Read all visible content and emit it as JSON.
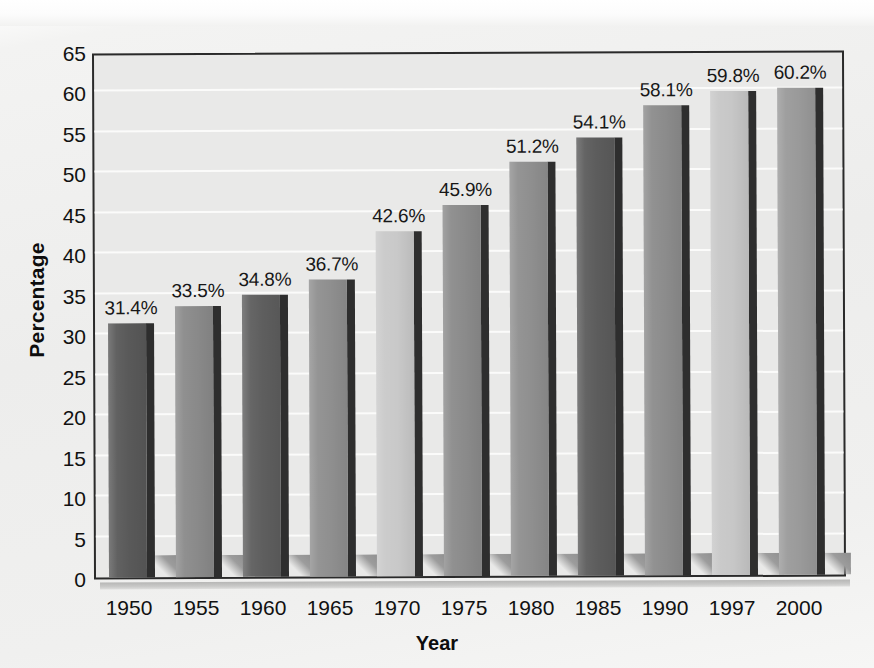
{
  "chart_data": {
    "type": "bar",
    "title": "",
    "xlabel": "Year",
    "ylabel": "Percentage",
    "categories": [
      "1950",
      "1955",
      "1960",
      "1965",
      "1970",
      "1975",
      "1980",
      "1985",
      "1990",
      "1997",
      "2000"
    ],
    "values": [
      31.4,
      33.5,
      34.8,
      36.7,
      42.6,
      45.9,
      51.2,
      54.1,
      58.1,
      59.8,
      60.2
    ],
    "value_labels": [
      "31.4%",
      "33.5%",
      "34.8%",
      "36.7%",
      "42.6%",
      "45.9%",
      "51.2%",
      "54.1%",
      "58.1%",
      "59.8%",
      "60.2%"
    ],
    "bar_colors": [
      "#595959",
      "#8a8a8a",
      "#5e5e5e",
      "#8f8f8f",
      "#c9c9c9",
      "#8b8b8b",
      "#8f8f8f",
      "#5c5c5c",
      "#8c8c8c",
      "#c7c7c7",
      "#9a9a9a"
    ],
    "ylim": [
      0,
      65
    ],
    "yticks": [
      "0",
      "5",
      "10",
      "15",
      "20",
      "25",
      "30",
      "35",
      "40",
      "45",
      "50",
      "55",
      "60",
      "65"
    ],
    "ytick_values": [
      0,
      5,
      10,
      15,
      20,
      25,
      30,
      35,
      40,
      45,
      50,
      55,
      60,
      65
    ],
    "ytick_step": 5,
    "grid": true,
    "grid_color": "#fbfbfa",
    "legend": "none",
    "plot_background": "#e9e9e8",
    "frame_color": "#2a2a2a",
    "units": "percent",
    "bar_style": "3d-extruded-with-drop-shadow"
  }
}
